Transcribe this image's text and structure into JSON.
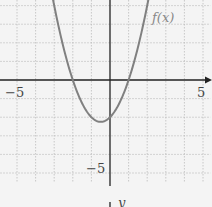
{
  "chart_data": {
    "type": "line",
    "title": "",
    "function_label": "f(x)",
    "equation_inferred": "f(x) = x^2 + x - 2",
    "xlabel": "",
    "ylabel": "y",
    "xlim": [
      -5.9,
      5.4
    ],
    "ylim": [
      -6.5,
      4.3
    ],
    "grid": true,
    "x_tick_labels": [
      "−5",
      "5"
    ],
    "y_tick_labels": [
      "−5"
    ],
    "series": [
      {
        "name": "f(x)",
        "x": [
          -3.4,
          -3,
          -2.5,
          -2,
          -1.5,
          -1,
          -0.5,
          0,
          0.5,
          1,
          1.5,
          2,
          2.4
        ],
        "values": [
          6.16,
          4,
          1.75,
          0,
          -1.25,
          -2,
          -2.25,
          -2,
          -1.25,
          0,
          1.75,
          4,
          5.16
        ],
        "color": "#808080"
      }
    ],
    "key_points": {
      "roots": [
        -2,
        1
      ],
      "y_intercept": -2,
      "vertex": [
        -0.5,
        -2.25
      ]
    }
  },
  "labels": {
    "x_neg5": "−5",
    "x_pos5": "5",
    "y_neg5": "−5",
    "func": "f(x)",
    "bottom_y": "y"
  }
}
